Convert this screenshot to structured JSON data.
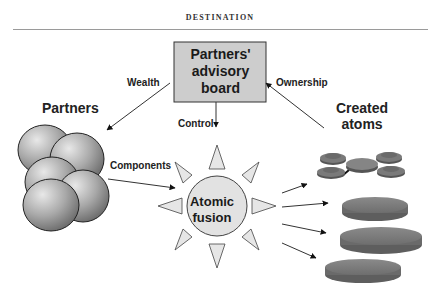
{
  "header": {
    "title": "DESTINATION"
  },
  "diagram": {
    "nodes": {
      "board": {
        "label": "Partners' advisory board",
        "lines": [
          "Partners'",
          "advisory",
          "board"
        ],
        "fill": "#cfcfcf"
      },
      "partners": {
        "label": "Partners"
      },
      "fusion": {
        "label": "Atomic fusion",
        "lines": [
          "Atomic",
          "fusion"
        ]
      },
      "created_atoms": {
        "label": "Created atoms",
        "lines": [
          "Created",
          "atoms"
        ]
      }
    },
    "edges": {
      "wealth": "Wealth",
      "ownership": "Ownership",
      "control": "Control",
      "components": "Components"
    }
  }
}
